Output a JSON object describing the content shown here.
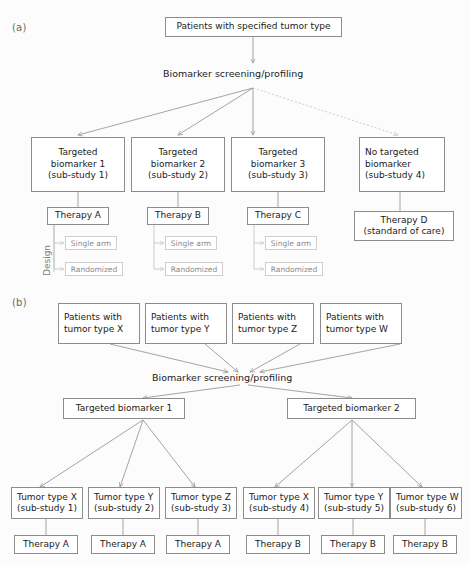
{
  "figure": {
    "panel_a_label": "(a)",
    "panel_b_label": "(b)"
  },
  "panel_a": {
    "root_box": {
      "line1": "Patients with specified tumor type"
    },
    "screening_text": "Biomarker screening/profiling",
    "design_label": "Design",
    "branches": [
      {
        "arm_line1": "Targeted",
        "arm_line2": "biomarker 1",
        "arm_line3": "(sub-study 1)",
        "therapy": "Therapy A",
        "design_options": [
          "Single arm",
          "Randomized"
        ]
      },
      {
        "arm_line1": "Targeted",
        "arm_line2": "biomarker 2",
        "arm_line3": "(sub-study 2)",
        "therapy": "Therapy B",
        "design_options": [
          "Single arm",
          "Randomized"
        ]
      },
      {
        "arm_line1": "Targeted",
        "arm_line2": "biomarker 3",
        "arm_line3": "(sub-study 3)",
        "therapy": "Therapy C",
        "design_options": [
          "Single arm",
          "Randomized"
        ]
      }
    ],
    "control_branch": {
      "arm_line1": "No targeted",
      "arm_line2": "biomarker",
      "arm_line3": "(sub-study 4)",
      "therapy_line1": "Therapy D",
      "therapy_line2": "(standard of care)"
    }
  },
  "panel_b": {
    "screening_text": "Biomarker screening/profiling",
    "patient_boxes": [
      {
        "line1": "Patients with",
        "line2": "tumor type X"
      },
      {
        "line1": "Patients with",
        "line2": "tumor type Y"
      },
      {
        "line1": "Patients with",
        "line2": "tumor type Z"
      },
      {
        "line1": "Patients with",
        "line2": "tumor type W"
      }
    ],
    "biomarker_boxes": [
      {
        "label": "Targeted biomarker 1"
      },
      {
        "label": "Targeted biomarker 2"
      }
    ],
    "left_group": [
      {
        "line1": "Tumor type X",
        "line2": "(sub-study 1)",
        "therapy": "Therapy A"
      },
      {
        "line1": "Tumor type Y",
        "line2": "(sub-study 2)",
        "therapy": "Therapy A"
      },
      {
        "line1": "Tumor type Z",
        "line2": "(sub-study 3)",
        "therapy": "Therapy A"
      }
    ],
    "right_group": [
      {
        "line1": "Tumor type X",
        "line2": "(sub-study 4)",
        "therapy": "Therapy B"
      },
      {
        "line1": "Tumor type Y",
        "line2": "(sub-study 5)",
        "therapy": "Therapy B"
      },
      {
        "line1": "Tumor type W",
        "line2": "(sub-study 6)",
        "therapy": "Therapy B"
      }
    ]
  },
  "colors": {
    "box_border": "#8c8c8c",
    "faint_border": "#cfcfcf",
    "connector": "#9a9a9a",
    "dashed_connector": "#c6c6c6",
    "text": "#1b1b1b",
    "muted_text": "#8a8a8a"
  }
}
